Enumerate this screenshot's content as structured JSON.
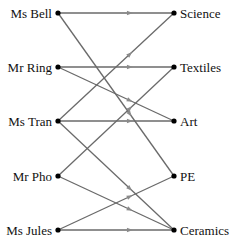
{
  "diagram": {
    "type": "bipartite-directed-graph",
    "left_nodes": [
      {
        "id": "bell",
        "label": "Ms Bell",
        "x": 58,
        "y": 13
      },
      {
        "id": "ring",
        "label": "Mr Ring",
        "x": 58,
        "y": 67
      },
      {
        "id": "tran",
        "label": "Ms Tran",
        "x": 58,
        "y": 121
      },
      {
        "id": "pho",
        "label": "Mr Pho",
        "x": 58,
        "y": 176
      },
      {
        "id": "jules",
        "label": "Ms Jules",
        "x": 58,
        "y": 230
      }
    ],
    "right_nodes": [
      {
        "id": "science",
        "label": "Science",
        "x": 174,
        "y": 13
      },
      {
        "id": "textiles",
        "label": "Textiles",
        "x": 174,
        "y": 67
      },
      {
        "id": "art",
        "label": "Art",
        "x": 174,
        "y": 121
      },
      {
        "id": "pe",
        "label": "PE",
        "x": 174,
        "y": 176
      },
      {
        "id": "ceramics",
        "label": "Ceramics",
        "x": 174,
        "y": 230
      }
    ],
    "edges": [
      {
        "from": "bell",
        "to": "science"
      },
      {
        "from": "bell",
        "to": "pe"
      },
      {
        "from": "ring",
        "to": "textiles"
      },
      {
        "from": "ring",
        "to": "art"
      },
      {
        "from": "tran",
        "to": "science"
      },
      {
        "from": "tran",
        "to": "art"
      },
      {
        "from": "tran",
        "to": "ceramics"
      },
      {
        "from": "pho",
        "to": "textiles"
      },
      {
        "from": "pho",
        "to": "ceramics"
      },
      {
        "from": "jules",
        "to": "pe"
      },
      {
        "from": "jules",
        "to": "ceramics"
      }
    ],
    "colors": {
      "edge": "#6a6a6a",
      "node": "#000000",
      "arrow": "#8a8a8a",
      "text": "#111111"
    }
  }
}
